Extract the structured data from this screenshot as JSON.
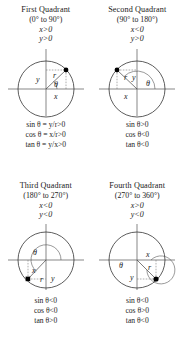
{
  "figure": {
    "quadrants": [
      {
        "id": "first",
        "name": "First Quadrant",
        "range": "(0° to 90°)",
        "cond_x": "x>0",
        "cond_y": "y>0",
        "diagram_labels": {
          "y": "y",
          "r": "r",
          "theta": "θ",
          "x": "x"
        },
        "formulas": [
          "sin θ = y/r>0",
          "cos θ = x/r>0",
          "tan θ = y/x>0"
        ]
      },
      {
        "id": "second",
        "name": "Second Quadrant",
        "range": "(90° to 180°)",
        "cond_x": "x<0",
        "cond_y": "y>0",
        "diagram_labels": {
          "r": "r",
          "y": "y",
          "theta": "θ",
          "x": "x"
        },
        "formulas": [
          "sin θ>0",
          "cos θ<0",
          "tan θ<0"
        ]
      },
      {
        "id": "third",
        "name": "Third Quadrant",
        "range": "(180° to 270°)",
        "cond_x": "x<0",
        "cond_y": "y<0",
        "diagram_labels": {
          "theta": "θ",
          "x": "x",
          "r": "r",
          "y": "y"
        },
        "formulas": [
          "sin θ<0",
          "cos θ<0",
          "tan θ>0"
        ]
      },
      {
        "id": "fourth",
        "name": "Fourth Quadrant",
        "range": "(270° to 360°)",
        "cond_x": "x>0",
        "cond_y": "y<0",
        "diagram_labels": {
          "x": "x",
          "theta": "θ",
          "r": "r",
          "y": "y"
        },
        "formulas": [
          "sin θ<0",
          "cos θ>0",
          "tan θ<0"
        ]
      }
    ],
    "colors": {
      "background": "#ffffff",
      "text": "#1a1a1a",
      "circle_stroke": "#333333",
      "axis_stroke": "#555555",
      "dashed_stroke": "#777777",
      "point_fill": "#000000"
    }
  }
}
